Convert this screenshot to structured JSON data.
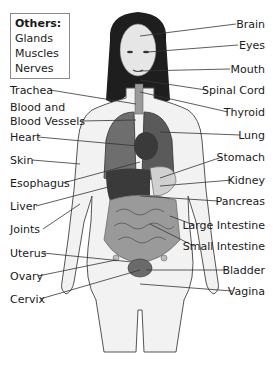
{
  "others_box": {
    "title": "Others:",
    "items": [
      "Glands",
      "Muscles",
      "Nerves"
    ]
  },
  "labels_left": [
    {
      "text": "Trachea",
      "y": 84
    },
    {
      "text": "Blood and",
      "y": 101
    },
    {
      "text": "Blood Vessels",
      "y": 115
    },
    {
      "text": "Heart",
      "y": 131
    },
    {
      "text": "Skin",
      "y": 154
    },
    {
      "text": "Esophagus",
      "y": 177
    },
    {
      "text": "Liver",
      "y": 200
    },
    {
      "text": "Joints",
      "y": 223
    },
    {
      "text": "Uterus",
      "y": 247
    },
    {
      "text": "Ovary",
      "y": 270
    },
    {
      "text": "Cervix",
      "y": 293
    }
  ],
  "labels_right": [
    {
      "text": "Brain",
      "y": 18
    },
    {
      "text": "Eyes",
      "y": 39
    },
    {
      "text": "Mouth",
      "y": 63
    },
    {
      "text": "Spinal Cord",
      "y": 84
    },
    {
      "text": "Thyroid",
      "y": 106
    },
    {
      "text": "Lung",
      "y": 129
    },
    {
      "text": "Stomach",
      "y": 151
    },
    {
      "text": "Kidney",
      "y": 174
    },
    {
      "text": "Pancreas",
      "y": 195
    },
    {
      "text": "Large Intestine",
      "y": 219
    },
    {
      "text": "Small Intestine",
      "y": 240
    },
    {
      "text": "Bladder",
      "y": 264
    },
    {
      "text": "Vagina",
      "y": 285
    }
  ],
  "colors": {
    "skin": "#f2f2f2",
    "outline": "#555555",
    "hair": "#1e1e1e",
    "organ_dark": "#3a3a3a",
    "organ_mid": "#7a7a7a",
    "leader_line": "#333333"
  }
}
